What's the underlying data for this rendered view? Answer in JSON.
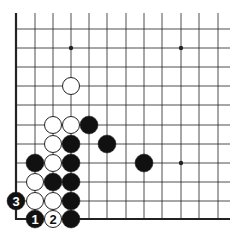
{
  "diagram": {
    "type": "go-board-fragment",
    "grid": {
      "columns_x": [
        16,
        35,
        53,
        71,
        89,
        107,
        126,
        144,
        162,
        181,
        199,
        218
      ],
      "rows_y": [
        29,
        48,
        67,
        86,
        105,
        125,
        144,
        163,
        182,
        201,
        219
      ],
      "top_open_y": 13,
      "right_open_x": 230,
      "edge_left_x": 16,
      "edge_bottom_y": 219
    },
    "star_points": [
      {
        "x": 71,
        "y": 48
      },
      {
        "x": 181,
        "y": 48
      },
      {
        "x": 181,
        "y": 163
      }
    ],
    "stone_radius": 9,
    "stones": [
      {
        "color": "white",
        "x": 71,
        "y": 86,
        "label": ""
      },
      {
        "color": "white",
        "x": 53,
        "y": 125,
        "label": ""
      },
      {
        "color": "white",
        "x": 71,
        "y": 125,
        "label": ""
      },
      {
        "color": "black",
        "x": 89,
        "y": 125,
        "label": ""
      },
      {
        "color": "white",
        "x": 53,
        "y": 144,
        "label": ""
      },
      {
        "color": "black",
        "x": 71,
        "y": 144,
        "label": ""
      },
      {
        "color": "black",
        "x": 107,
        "y": 144,
        "label": ""
      },
      {
        "color": "black",
        "x": 35,
        "y": 163,
        "label": ""
      },
      {
        "color": "white",
        "x": 53,
        "y": 163,
        "label": ""
      },
      {
        "color": "black",
        "x": 71,
        "y": 163,
        "label": ""
      },
      {
        "color": "black",
        "x": 144,
        "y": 163,
        "label": ""
      },
      {
        "color": "white",
        "x": 35,
        "y": 182,
        "label": ""
      },
      {
        "color": "black",
        "x": 53,
        "y": 182,
        "label": ""
      },
      {
        "color": "black",
        "x": 71,
        "y": 182,
        "label": ""
      },
      {
        "color": "black",
        "x": 16,
        "y": 201,
        "label": "3"
      },
      {
        "color": "white",
        "x": 35,
        "y": 201,
        "label": ""
      },
      {
        "color": "white",
        "x": 53,
        "y": 201,
        "label": ""
      },
      {
        "color": "black",
        "x": 71,
        "y": 201,
        "label": ""
      },
      {
        "color": "black",
        "x": 35,
        "y": 219,
        "label": "1"
      },
      {
        "color": "white",
        "x": 53,
        "y": 219,
        "label": "2"
      },
      {
        "color": "black",
        "x": 71,
        "y": 219,
        "label": ""
      }
    ],
    "colors": {
      "line": "#222222",
      "black_stone": "#111111",
      "white_stone": "#ffffff",
      "background": "#ffffff"
    }
  }
}
